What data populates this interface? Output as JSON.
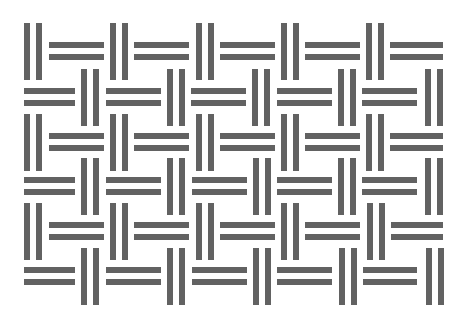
{
  "pattern": {
    "name": "basket-weave",
    "bar_color": "#626262",
    "background": "#ffffff",
    "bar_thickness": 6,
    "bar_gap": 6,
    "vertical_group": {
      "width": 18,
      "height": 57
    },
    "rows": [
      {
        "v_top": 23,
        "h_top": 42,
        "cells": [
          {
            "type": "V",
            "x": 24
          },
          {
            "type": "H",
            "x": 49,
            "w": 55
          },
          {
            "type": "V",
            "x": 110
          },
          {
            "type": "H",
            "x": 134,
            "w": 55
          },
          {
            "type": "V",
            "x": 196
          },
          {
            "type": "H",
            "x": 220,
            "w": 55
          },
          {
            "type": "V",
            "x": 281
          },
          {
            "type": "H",
            "x": 305,
            "w": 55
          },
          {
            "type": "V",
            "x": 366
          },
          {
            "type": "H",
            "x": 390,
            "w": 53
          }
        ]
      },
      {
        "v_top": 69,
        "h_top": 88,
        "cells": [
          {
            "type": "H",
            "x": 24,
            "w": 51
          },
          {
            "type": "V",
            "x": 81
          },
          {
            "type": "H",
            "x": 106,
            "w": 55
          },
          {
            "type": "V",
            "x": 167
          },
          {
            "type": "H",
            "x": 191,
            "w": 55
          },
          {
            "type": "V",
            "x": 252
          },
          {
            "type": "H",
            "x": 277,
            "w": 55
          },
          {
            "type": "V",
            "x": 338
          },
          {
            "type": "H",
            "x": 362,
            "w": 55
          },
          {
            "type": "V",
            "x": 425
          }
        ]
      },
      {
        "v_top": 114,
        "h_top": 133,
        "cells": [
          {
            "type": "V",
            "x": 24
          },
          {
            "type": "H",
            "x": 49,
            "w": 55
          },
          {
            "type": "V",
            "x": 110
          },
          {
            "type": "H",
            "x": 134,
            "w": 55
          },
          {
            "type": "V",
            "x": 196
          },
          {
            "type": "H",
            "x": 220,
            "w": 55
          },
          {
            "type": "V",
            "x": 281
          },
          {
            "type": "H",
            "x": 305,
            "w": 55
          },
          {
            "type": "V",
            "x": 366
          },
          {
            "type": "H",
            "x": 390,
            "w": 53
          }
        ]
      },
      {
        "v_top": 158,
        "h_top": 177,
        "cells": [
          {
            "type": "H",
            "x": 24,
            "w": 51
          },
          {
            "type": "V",
            "x": 81
          },
          {
            "type": "H",
            "x": 106,
            "w": 55
          },
          {
            "type": "V",
            "x": 167
          },
          {
            "type": "H",
            "x": 192,
            "w": 55
          },
          {
            "type": "V",
            "x": 253
          },
          {
            "type": "H",
            "x": 277,
            "w": 55
          },
          {
            "type": "V",
            "x": 338
          },
          {
            "type": "H",
            "x": 362,
            "w": 55
          },
          {
            "type": "V",
            "x": 425
          }
        ]
      },
      {
        "v_top": 203,
        "h_top": 222,
        "cells": [
          {
            "type": "V",
            "x": 24
          },
          {
            "type": "H",
            "x": 49,
            "w": 55
          },
          {
            "type": "V",
            "x": 110
          },
          {
            "type": "H",
            "x": 134,
            "w": 55
          },
          {
            "type": "V",
            "x": 196
          },
          {
            "type": "H",
            "x": 220,
            "w": 55
          },
          {
            "type": "V",
            "x": 281
          },
          {
            "type": "H",
            "x": 305,
            "w": 55
          },
          {
            "type": "V",
            "x": 367
          },
          {
            "type": "H",
            "x": 391,
            "w": 52
          }
        ]
      },
      {
        "v_top": 248,
        "h_top": 267,
        "cells": [
          {
            "type": "H",
            "x": 24,
            "w": 51
          },
          {
            "type": "V",
            "x": 81
          },
          {
            "type": "H",
            "x": 106,
            "w": 55
          },
          {
            "type": "V",
            "x": 167
          },
          {
            "type": "H",
            "x": 192,
            "w": 55
          },
          {
            "type": "V",
            "x": 253
          },
          {
            "type": "H",
            "x": 277,
            "w": 55
          },
          {
            "type": "V",
            "x": 339
          },
          {
            "type": "H",
            "x": 363,
            "w": 54
          },
          {
            "type": "V",
            "x": 426
          }
        ]
      }
    ]
  }
}
